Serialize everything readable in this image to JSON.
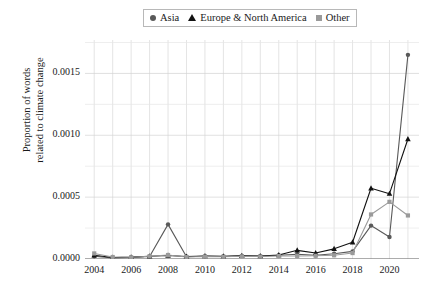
{
  "legend": {
    "position": "top-center",
    "entries": [
      {
        "label": "Asia",
        "marker": "circle-icon",
        "color": "#595959"
      },
      {
        "label": "Europe & North America",
        "marker": "triangle-icon",
        "color": "#111111"
      },
      {
        "label": "Other",
        "marker": "square-icon",
        "color": "#9a9a9a"
      }
    ]
  },
  "axes": {
    "ylabel_line1": "Proportion of words",
    "ylabel_line2": "related to climate change",
    "xlabel": "",
    "yticks": [
      "0.0000",
      "0.0005",
      "0.0010",
      "0.0015"
    ],
    "xticks": [
      "2004",
      "2006",
      "2008",
      "2010",
      "2012",
      "2014",
      "2016",
      "2018",
      "2020"
    ]
  },
  "chart_data": {
    "type": "line",
    "title": "",
    "xlabel": "",
    "ylabel": "Proportion of words related to climate change",
    "x": [
      2004,
      2005,
      2006,
      2007,
      2008,
      2009,
      2010,
      2011,
      2012,
      2013,
      2014,
      2015,
      2016,
      2017,
      2018,
      2019,
      2020,
      2021
    ],
    "xlim": [
      2003.5,
      2021.6
    ],
    "ylim": [
      0.0,
      0.00177
    ],
    "yticks": [
      0.0,
      0.0005,
      0.001,
      0.0015
    ],
    "grid": true,
    "legend_position": "top-center",
    "series": [
      {
        "name": "Asia",
        "color": "#595959",
        "marker": "circle",
        "values": [
          2.2e-05,
          8e-06,
          1.2e-05,
          2e-05,
          0.00028,
          1.8e-05,
          2.2e-05,
          2e-05,
          2.5e-05,
          2.2e-05,
          3e-05,
          3.8e-05,
          3e-05,
          4.2e-05,
          6.2e-05,
          0.00027,
          0.000178,
          0.00165
        ]
      },
      {
        "name": "Europe & North America",
        "color": "#111111",
        "marker": "triangle",
        "values": [
          3e-05,
          1.2e-05,
          1.5e-05,
          2.2e-05,
          2.8e-05,
          2e-05,
          2.4e-05,
          2.2e-05,
          2.6e-05,
          2.4e-05,
          3.2e-05,
          7e-05,
          4.8e-05,
          8.2e-05,
          0.000135,
          0.000572,
          0.000528,
          0.00097
        ]
      },
      {
        "name": "Other",
        "color": "#9a9a9a",
        "marker": "square",
        "values": [
          4.5e-05,
          1.6e-05,
          1.4e-05,
          2.2e-05,
          3.2e-05,
          1.6e-05,
          2e-05,
          1.8e-05,
          2.2e-05,
          2e-05,
          2.4e-05,
          2.4e-05,
          2.6e-05,
          3e-05,
          4.8e-05,
          0.00036,
          0.000462,
          0.000352
        ]
      }
    ]
  }
}
